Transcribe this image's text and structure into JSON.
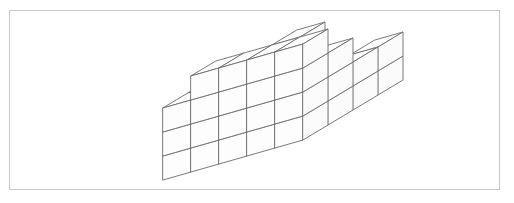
{
  "page": {
    "width": 514,
    "height": 203,
    "background_color": "#ffffff"
  },
  "frame": {
    "name": "image-border",
    "x": 9,
    "y": 10,
    "width": 491,
    "height": 180,
    "stroke_color": "#c9c9c9",
    "stroke_width": 1
  },
  "figure": {
    "name": "cube-stack",
    "line_color": "#6b6b6b",
    "face_color": "#ffffff",
    "line_width": 0.9,
    "projection": {
      "type": "isometric",
      "origin_x": 163,
      "origin_y": 180,
      "cube_width_x": 28,
      "cube_rise_x": -8,
      "cube_width_y": 25,
      "cube_rise_y": -15,
      "cube_height": 24
    },
    "footprint_cols": 5,
    "footprint_rows": 4,
    "max_height": 4,
    "height_map": [
      [
        3,
        4,
        4,
        4,
        4
      ],
      [
        3,
        3,
        3,
        4,
        3
      ],
      [
        1,
        3,
        3,
        2,
        2
      ],
      [
        1,
        1,
        1,
        1,
        2
      ]
    ],
    "total_cubes": 55
  }
}
